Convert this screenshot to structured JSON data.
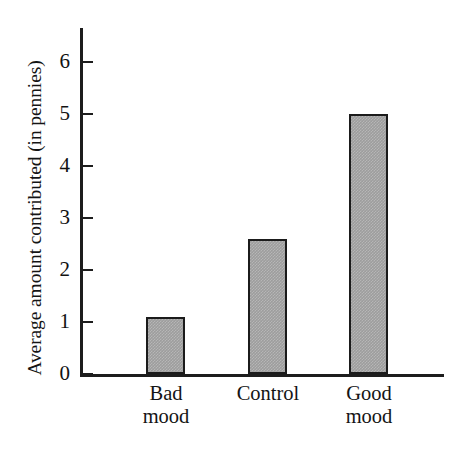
{
  "chart_data": {
    "type": "bar",
    "title": "",
    "subtitle": "",
    "xlabel": "",
    "ylabel": "Average amount contributed (in pennies)",
    "categories": [
      "Bad mood",
      "Control",
      "Good mood"
    ],
    "category_lines": [
      [
        "Bad",
        "mood"
      ],
      [
        "Control",
        ""
      ],
      [
        "Good",
        "mood"
      ]
    ],
    "values": [
      1.1,
      2.6,
      5.0
    ],
    "ylim": [
      0,
      6
    ],
    "yticks": [
      0,
      1,
      2,
      3,
      4,
      5,
      6
    ],
    "ytick_labels": [
      "0",
      "1",
      "2",
      "3",
      "4",
      "5",
      "6"
    ],
    "grid": false,
    "legend": false,
    "legend_position": "none",
    "bar_fill_color": "#9d9d9d",
    "bar_border_color": "#1b1b1b",
    "axis_color": "#1d1d1d",
    "background_color": "#ffffff"
  }
}
